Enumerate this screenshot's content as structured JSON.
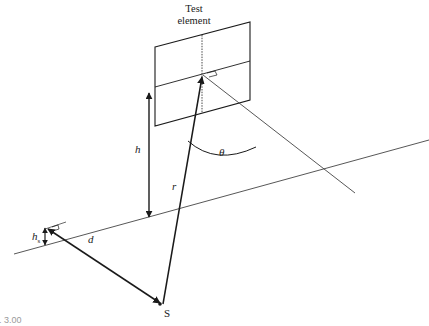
{
  "diagram": {
    "title_line1": "Test",
    "title_line2": "element",
    "labels": {
      "h": "h",
      "r": "r",
      "theta": "θ",
      "hs_main": "h",
      "hs_sub": "s",
      "d": "d",
      "source": "S"
    },
    "caption": "... 3.00",
    "colors": {
      "stroke": "#1a1a1a",
      "thin_stroke": "#444444",
      "background": "#ffffff"
    }
  }
}
